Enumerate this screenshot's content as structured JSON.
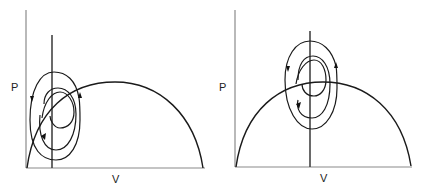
{
  "panels": [
    {
      "id": "left",
      "y_axis_label": "P",
      "x_axis_label": "V",
      "description": "Spiral trajectory centered left of the arc, near the vertical line close to the y-axis"
    },
    {
      "id": "right",
      "y_axis_label": "P",
      "x_axis_label": "V",
      "description": "Spiral trajectory centered on the vertical line near the peak of the arc"
    }
  ],
  "colors": {
    "axis": "#8a8a8a",
    "curve": "#1a1a1a",
    "background": "#ffffff"
  }
}
